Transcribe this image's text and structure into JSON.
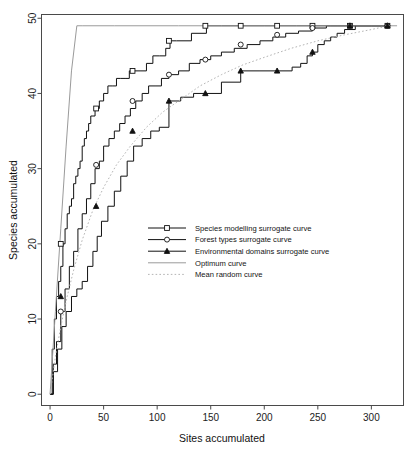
{
  "chart_data": {
    "type": "line",
    "title": "",
    "xlabel": "Sites accumulated",
    "ylabel": "Species accumulated",
    "xlim": [
      -8,
      330
    ],
    "ylim": [
      -1.5,
      50.5
    ],
    "xticks": [
      0,
      50,
      100,
      150,
      200,
      250,
      300
    ],
    "yticks": [
      0,
      10,
      20,
      30,
      40,
      50
    ],
    "grid": false,
    "legend_position": "center",
    "series": [
      {
        "name": "Species modelling surrogate curve",
        "marker": "open-square",
        "line_style": "solid",
        "color": "#111111",
        "x": [
          0,
          2,
          4,
          6,
          8,
          10,
          12,
          14,
          16,
          18,
          20,
          22,
          24,
          26,
          28,
          30,
          32,
          34,
          36,
          38,
          40,
          42,
          44,
          46,
          50,
          54,
          58,
          62,
          66,
          70,
          74,
          78,
          84,
          90,
          96,
          102,
          108,
          112,
          118,
          126,
          132,
          140,
          146,
          160,
          178,
          200,
          212,
          230,
          245,
          262,
          280,
          300,
          316
        ],
        "y": [
          0,
          6,
          10,
          13,
          15,
          17,
          20,
          22,
          24,
          25,
          26,
          28,
          29,
          30,
          31,
          33,
          34,
          35,
          36,
          37,
          37,
          38,
          38,
          39,
          40,
          41,
          41,
          42,
          42,
          42,
          43,
          43,
          43,
          44,
          45,
          45,
          46,
          47,
          47,
          47,
          48,
          48,
          49,
          49,
          49,
          49,
          49,
          49,
          49,
          49,
          49,
          49,
          49
        ],
        "marker_x": [
          10,
          43,
          77,
          111,
          145,
          178,
          212,
          245,
          280,
          315
        ],
        "marker_y": [
          20,
          38,
          43,
          47,
          49,
          49,
          49,
          49,
          49,
          49
        ]
      },
      {
        "name": "Forest types surrogate curve",
        "marker": "open-circle",
        "line_style": "solid",
        "color": "#111111",
        "x": [
          0,
          3,
          6,
          10,
          14,
          18,
          22,
          26,
          30,
          34,
          38,
          42,
          46,
          50,
          55,
          60,
          65,
          70,
          75,
          80,
          86,
          92,
          98,
          104,
          111,
          120,
          130,
          140,
          150,
          160,
          172,
          184,
          196,
          208,
          220,
          232,
          245,
          258,
          268,
          280,
          300,
          316
        ],
        "y": [
          0,
          4,
          7,
          11,
          14,
          17,
          19,
          22,
          24,
          26,
          28,
          30,
          31,
          33,
          34,
          35,
          36,
          37,
          38,
          39,
          40,
          41,
          41,
          42,
          42.5,
          43,
          44,
          44.5,
          45,
          45.5,
          46,
          46.5,
          47,
          47.5,
          48,
          48.3,
          48.7,
          49,
          49,
          49,
          49,
          49
        ],
        "marker_x": [
          10,
          43,
          77,
          111,
          145,
          178,
          212,
          245,
          280,
          315
        ],
        "marker_y": [
          11,
          30.5,
          39,
          42.5,
          44.5,
          46.5,
          47.8,
          48.7,
          49,
          49
        ]
      },
      {
        "name": "Environmental domains surrogate curve",
        "marker": "filled-triangle",
        "line_style": "solid",
        "color": "#111111",
        "x": [
          0,
          3,
          7,
          11,
          15,
          20,
          25,
          30,
          35,
          40,
          44,
          48,
          54,
          60,
          66,
          72,
          78,
          86,
          94,
          102,
          111,
          122,
          134,
          145,
          160,
          178,
          196,
          212,
          226,
          234,
          240,
          245,
          250,
          256,
          262,
          268,
          275,
          285,
          300,
          316
        ],
        "y": [
          0,
          3,
          6,
          9,
          11,
          13,
          14,
          15,
          17,
          19,
          21,
          23,
          25,
          27,
          29,
          31,
          33,
          34,
          35,
          35.5,
          39,
          39.5,
          40,
          40,
          41.5,
          43,
          43,
          43,
          43.5,
          44,
          45,
          45.5,
          46.5,
          47,
          47.5,
          48,
          48.5,
          49,
          49,
          49
        ],
        "marker_x": [
          10,
          43,
          77,
          111,
          145,
          178,
          212,
          245,
          280,
          315
        ],
        "marker_y": [
          13,
          25,
          35,
          39,
          40,
          43,
          43,
          45.5,
          49,
          49
        ]
      },
      {
        "name": "Optimum curve",
        "marker": "none",
        "line_style": "solid",
        "color": "#9a9a9a",
        "x": [
          0,
          5,
          10,
          15,
          20,
          25,
          30,
          60,
          120,
          200,
          280,
          324
        ],
        "y": [
          0,
          11,
          22,
          33,
          43,
          49,
          49,
          49,
          49,
          49,
          49,
          49
        ]
      },
      {
        "name": "Mean random curve",
        "marker": "none",
        "line_style": "dotted",
        "color": "#b4b4b4",
        "x": [
          0,
          5,
          10,
          16,
          22,
          30,
          40,
          50,
          62,
          75,
          90,
          105,
          120,
          140,
          160,
          180,
          200,
          225,
          250,
          275,
          300,
          316
        ],
        "y": [
          0,
          5,
          9,
          13,
          16.5,
          20.5,
          24.5,
          27.5,
          30.5,
          33,
          35.5,
          37.5,
          39,
          41,
          42.5,
          43.8,
          44.8,
          46,
          47,
          47.8,
          48.5,
          49
        ]
      }
    ],
    "legend": [
      {
        "label": "Species modelling surrogate curve",
        "marker": "open-square",
        "style": "solid",
        "color": "#111111"
      },
      {
        "label": "Forest types surrogate curve",
        "marker": "open-circle",
        "style": "solid",
        "color": "#111111"
      },
      {
        "label": "Environmental domains surrogate curve",
        "marker": "filled-triangle",
        "style": "solid",
        "color": "#111111"
      },
      {
        "label": "Optimum curve",
        "marker": "none",
        "style": "solid",
        "color": "#9a9a9a"
      },
      {
        "label": "Mean random curve",
        "marker": "none",
        "style": "dotted",
        "color": "#b4b4b4"
      }
    ]
  },
  "axes": {
    "x_title": "Sites accumulated",
    "y_title": "Species accumulated",
    "x_tick_labels": [
      "0",
      "50",
      "100",
      "150",
      "200",
      "250",
      "300"
    ],
    "y_tick_labels": [
      "0",
      "10",
      "20",
      "30",
      "40",
      "50"
    ]
  }
}
